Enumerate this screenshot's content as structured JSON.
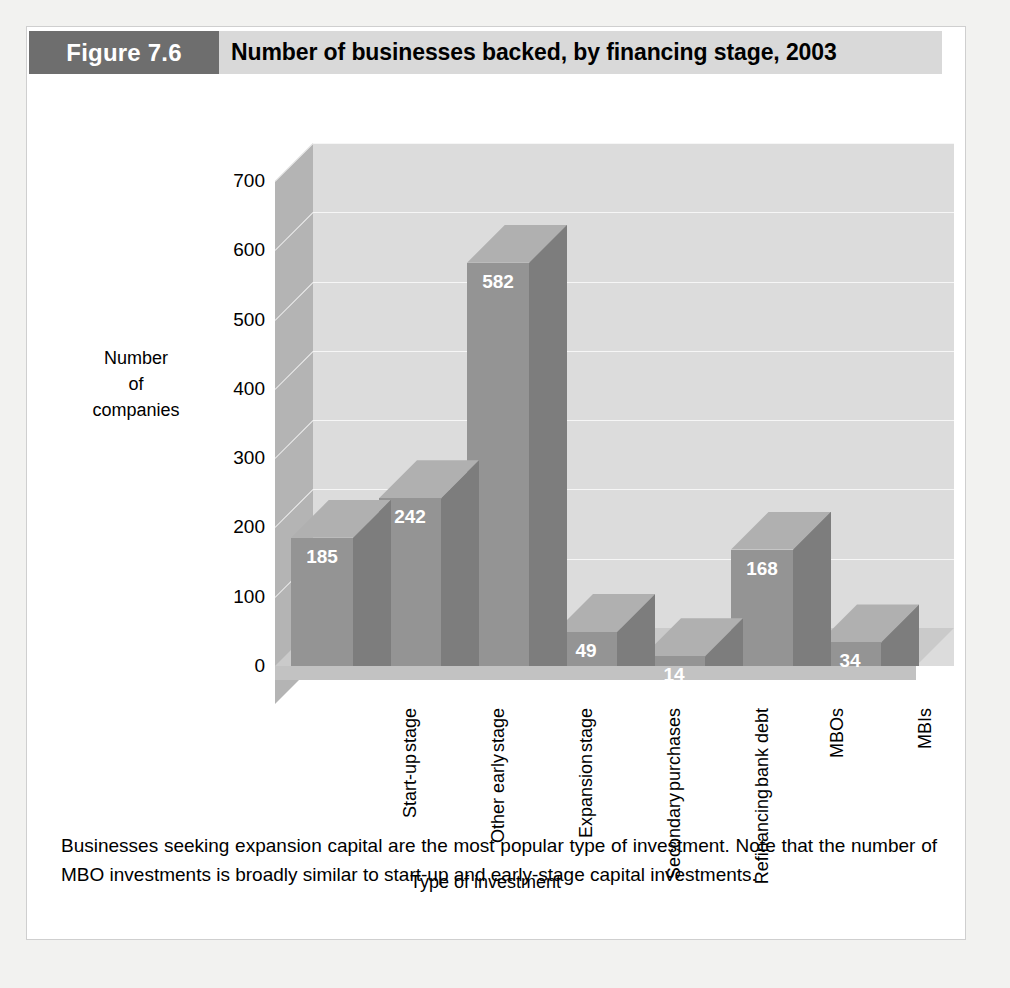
{
  "figure": {
    "tag": "Figure 7.6",
    "title": "Number of businesses backed, by financing stage, 2003",
    "caption": "Businesses seeking expansion capital are the most popular type of investment. Note that the number of MBO investments is broadly similar to start-up and early-stage capital investments."
  },
  "colors": {
    "tag_background": "#6e6e6e",
    "header_background": "#d9d9d9",
    "bar_front": "#949494",
    "bar_side": "#7d7d7d",
    "bar_top": "#b0b0b0",
    "wall_back": "#dcdcdc",
    "wall_left": "#b4b4b4",
    "floor": "#cacaca",
    "gridline": "#f6f6f6",
    "page_background": "#f2f2f0",
    "panel_background": "#ffffff",
    "label_text": "#ffffff"
  },
  "chart_data": {
    "type": "bar",
    "title": "Number of businesses backed, by financing stage, 2003",
    "xlabel": "Type of investment",
    "ylabel": "Number of companies",
    "ylabel_lines": [
      "Number",
      "of",
      "companies"
    ],
    "categories": [
      "Start-up stage",
      "Other early stage",
      "Expansion stage",
      "Secondary purchases",
      "Refinancing bank debt",
      "MBOs",
      "MBIs"
    ],
    "category_lines": [
      [
        "Start-up",
        "stage"
      ],
      [
        "Other early",
        "stage"
      ],
      [
        "Expansion",
        "stage"
      ],
      [
        "Secondary",
        "purchases"
      ],
      [
        "Refinancing",
        "bank debt"
      ],
      [
        "MBOs"
      ],
      [
        "MBIs"
      ]
    ],
    "values": [
      185,
      242,
      582,
      49,
      14,
      168,
      34
    ],
    "value_labels": [
      "185",
      "242",
      "582",
      "49",
      "14",
      "168",
      "34"
    ],
    "yticks": [
      700,
      600,
      500,
      400,
      300,
      200,
      100,
      0
    ],
    "ytick_labels": [
      "700",
      "600",
      "500",
      "400",
      "300",
      "200",
      "100",
      "0"
    ],
    "ylim": [
      0,
      700
    ],
    "grid": true,
    "legend": false,
    "three_d": true
  }
}
